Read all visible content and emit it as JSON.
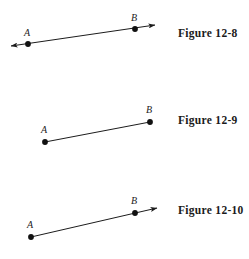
{
  "page": {
    "background_color": "#ffffff",
    "ink_color": "#1c1c1c",
    "width": 249,
    "height": 259
  },
  "figures": [
    {
      "id": "figure-12-8",
      "caption": "Figure 12-8",
      "geometry_type": "line",
      "description": "A line through points A and B with arrowheads at both ends",
      "points": [
        {
          "label": "A",
          "x": 28,
          "y": 44,
          "label_x": 24,
          "label_y": 36
        },
        {
          "label": "B",
          "x": 135,
          "y": 29,
          "label_x": 131,
          "label_y": 21
        }
      ],
      "segment": {
        "x1": 11,
        "y1": 46,
        "x2": 155,
        "y2": 25
      },
      "arrow_start": true,
      "arrow_end": true
    },
    {
      "id": "figure-12-9",
      "caption": "Figure 12-9",
      "geometry_type": "segment",
      "description": "A line segment with endpoints A and B, no arrowheads",
      "points": [
        {
          "label": "A",
          "x": 45,
          "y": 142,
          "label_x": 41,
          "label_y": 133
        },
        {
          "label": "B",
          "x": 150,
          "y": 122,
          "label_x": 146,
          "label_y": 113
        }
      ],
      "segment": {
        "x1": 45,
        "y1": 142,
        "x2": 150,
        "y2": 122
      },
      "arrow_start": false,
      "arrow_end": false
    },
    {
      "id": "figure-12-10",
      "caption": "Figure 12-10",
      "geometry_type": "ray",
      "description": "A ray starting at endpoint A passing through B with an arrowhead past B",
      "points": [
        {
          "label": "A",
          "x": 31,
          "y": 237,
          "label_x": 27,
          "label_y": 228
        },
        {
          "label": "B",
          "x": 135,
          "y": 213,
          "label_x": 131,
          "label_y": 204
        }
      ],
      "segment": {
        "x1": 31,
        "y1": 237,
        "x2": 157,
        "y2": 208
      },
      "arrow_start": false,
      "arrow_end": true
    }
  ]
}
